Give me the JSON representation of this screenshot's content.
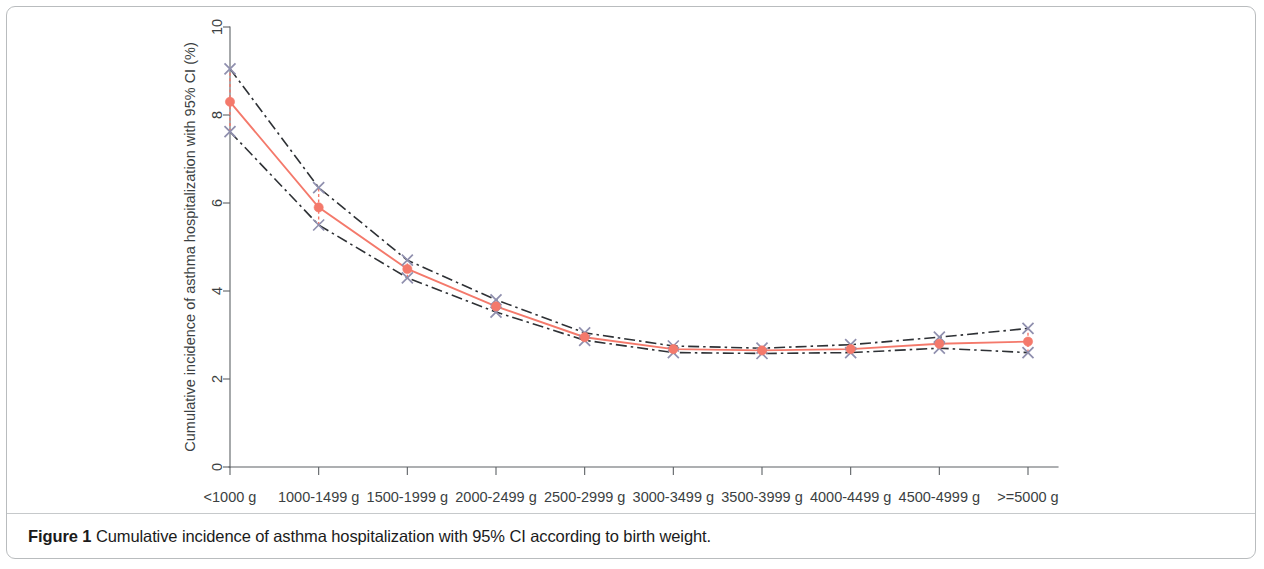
{
  "figure": {
    "caption_label": "Figure 1",
    "caption_text": "Cumulative incidence of asthma hospitalization with 95% CI according to birth weight."
  },
  "chart_data": {
    "type": "line",
    "title": "",
    "xlabel": "Birth weight",
    "ylabel": "Cumulative incidence of asthma hospitalization with 95% CI (%)",
    "categories": [
      "<1000 g",
      "1000-1499 g",
      "1500-1999 g",
      "2000-2499 g",
      "2500-2999 g",
      "3000-3499 g",
      "3500-3999 g",
      "4000-4499 g",
      "4500-4999 g",
      ">=5000 g"
    ],
    "ylim": [
      0,
      10
    ],
    "yticks": [
      0,
      2,
      4,
      6,
      8,
      10
    ],
    "ytick_labels": [
      "0",
      "2",
      "4",
      "6",
      "8",
      "10"
    ],
    "grid": false,
    "legend": "none",
    "series": [
      {
        "name": "Cumulative incidence",
        "role": "estimate",
        "color": "#f4796b",
        "marker": "filled-circle",
        "values": [
          8.3,
          5.9,
          4.5,
          3.65,
          2.95,
          2.68,
          2.65,
          2.68,
          2.8,
          2.85
        ]
      },
      {
        "name": "Upper 95% CI",
        "role": "ci-upper",
        "color": "#2e3135",
        "marker": "x",
        "values": [
          9.05,
          6.35,
          4.7,
          3.8,
          3.05,
          2.75,
          2.7,
          2.78,
          2.95,
          3.15
        ]
      },
      {
        "name": "Lower 95% CI",
        "role": "ci-lower",
        "color": "#2e3135",
        "marker": "x",
        "values": [
          7.62,
          5.5,
          4.3,
          3.52,
          2.88,
          2.6,
          2.58,
          2.6,
          2.7,
          2.6
        ]
      }
    ]
  }
}
